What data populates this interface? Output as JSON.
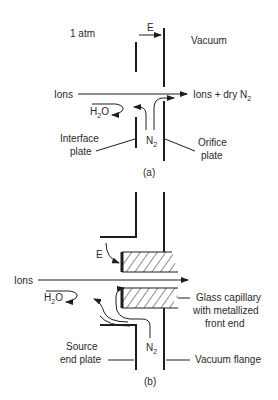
{
  "panel_a": {
    "caption": "(a)",
    "pressure_label": "1 atm",
    "field_label": "E",
    "vacuum_label": "Vacuum",
    "ions_in_label": "Ions",
    "ions_out_label": "Ions + dry N",
    "ions_out_sub": "2",
    "water_label": "H",
    "water_sub": "2",
    "water_tail": "O",
    "n2_label": "N",
    "n2_sub": "2",
    "interface_plate_line1": "Interface",
    "interface_plate_line2": "plate",
    "orifice_plate_line1": "Orifice",
    "orifice_plate_line2": "plate"
  },
  "panel_b": {
    "caption": "(b)",
    "field_label": "E",
    "ions_in_label": "Ions",
    "water_label": "H",
    "water_sub": "2",
    "water_tail": "O",
    "n2_label": "N",
    "n2_sub": "2",
    "capillary_line1": "Glass capillary",
    "capillary_line2": "with metallized",
    "capillary_line3": "front end",
    "source_plate_line1": "Source",
    "source_plate_line2": "end plate",
    "flange_label": "Vacuum flange"
  },
  "colors": {
    "ink": "#1e1e1e",
    "background": "#ffffff"
  }
}
